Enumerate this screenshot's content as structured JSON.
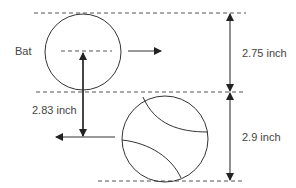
{
  "diagram": {
    "labels": {
      "bat": "Bat",
      "top_distance": "2.75 inch",
      "vertical_gap": "2.83 inch",
      "bottom_distance": "2.9 inch"
    },
    "colors": {
      "stroke": "#333333",
      "dash": "#555555",
      "text": "#444444",
      "background": "#ffffff"
    }
  }
}
